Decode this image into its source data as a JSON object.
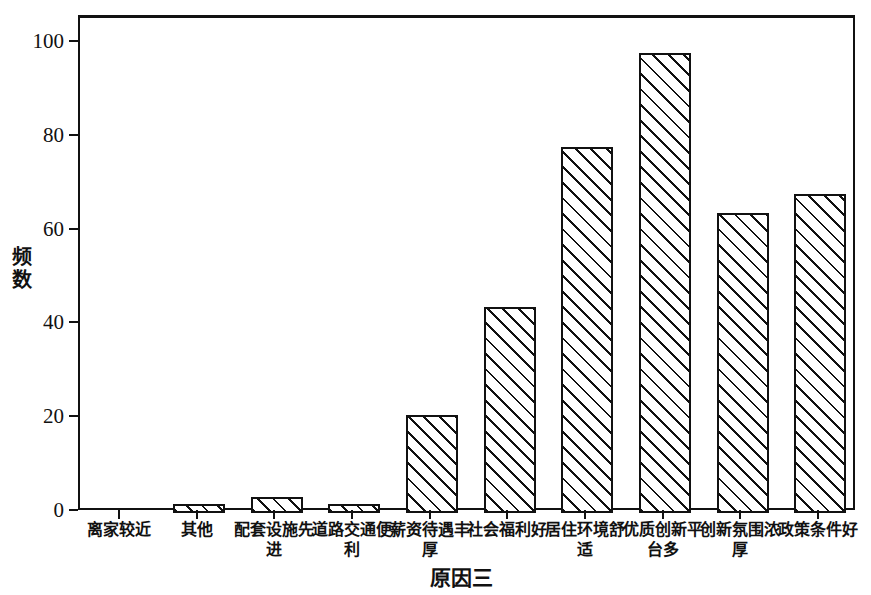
{
  "chart_data": {
    "type": "bar",
    "title": "",
    "xlabel": "原因三",
    "ylabel": "频数",
    "ylim": [
      0,
      107
    ],
    "yticks": [
      0,
      20,
      40,
      60,
      80,
      100
    ],
    "ytick_labels": [
      "0",
      "20",
      "40",
      "60",
      "80",
      "100"
    ],
    "grid": false,
    "legend": null,
    "categories": [
      "离家较近",
      "其他",
      "配套设施先进",
      "道路交通便利",
      "薪资待遇丰厚",
      "社会福利好",
      "居住环境舒适",
      "优质创新平台多",
      "创新氛围浓厚",
      "政策条件好"
    ],
    "values": [
      2,
      3.5,
      2,
      21,
      44,
      78,
      98,
      64,
      68,
      97
    ],
    "bar_style": {
      "fill": "#ffffff",
      "edge": "#111111",
      "hatch": "diagonal-45"
    }
  }
}
